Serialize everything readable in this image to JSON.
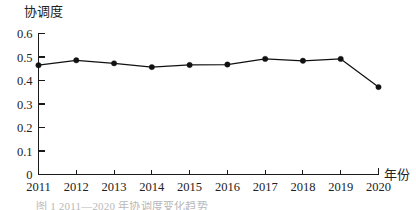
{
  "chart_data": {
    "type": "line",
    "title": "",
    "subtitle": "",
    "xlabel": "年份",
    "ylabel": "协调度",
    "categories": [
      "2011",
      "2012",
      "2013",
      "2014",
      "2015",
      "2016",
      "2017",
      "2018",
      "2019",
      "2020"
    ],
    "values": [
      0.465,
      0.486,
      0.473,
      0.457,
      0.466,
      0.468,
      0.492,
      0.484,
      0.492,
      0.372
    ],
    "series": [
      {
        "name": "协调度",
        "values": [
          0.465,
          0.486,
          0.473,
          0.457,
          0.466,
          0.468,
          0.492,
          0.484,
          0.492,
          0.372
        ]
      }
    ],
    "ylim": [
      0,
      0.6
    ],
    "yticks": [
      "0",
      "0.1",
      "0.2",
      "0.3",
      "0.4",
      "0.5",
      "0.6"
    ],
    "ytick_values": [
      0,
      0.1,
      0.2,
      0.3,
      0.4,
      0.5,
      0.6
    ],
    "xticks": [
      "2011",
      "2012",
      "2013",
      "2014",
      "2015",
      "2016",
      "2017",
      "2018",
      "2019",
      "2020"
    ],
    "grid": false,
    "legend": false,
    "legend_position": "none",
    "marker": "filled-circle",
    "line_color": "#111111",
    "marker_color": "#111111",
    "axis_color": "#1a1a1a",
    "annotations": []
  },
  "axes": {
    "y_axis_label": "协调度",
    "x_axis_label": "年份"
  },
  "caption": {
    "text": "图 1  2011—2020 年协调度变化趋势"
  }
}
